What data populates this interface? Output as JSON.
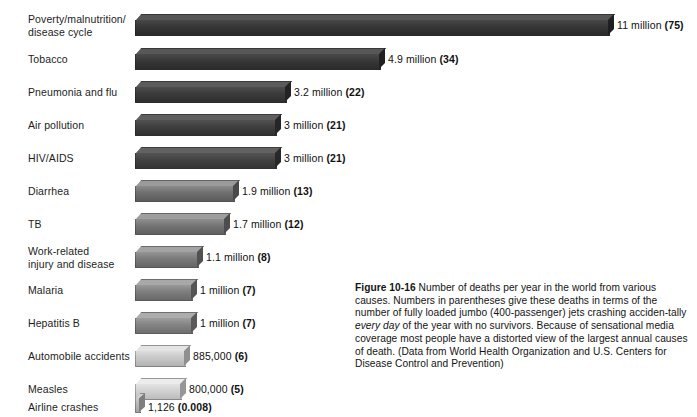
{
  "chart_data": {
    "type": "bar",
    "orientation": "horizontal",
    "title": "",
    "xlabel": "",
    "ylabel": "",
    "categories": [
      "Poverty/malnutrition/\ndisease cycle",
      "Tobacco",
      "Pneumonia and flu",
      "Air pollution",
      "HIV/AIDS",
      "Diarrhea",
      "TB",
      "Work-related\ninjury and disease",
      "Malaria",
      "Hepatitis B",
      "Automobile accidents",
      "Measles",
      "Airline crashes"
    ],
    "values": [
      11000000,
      4900000,
      3200000,
      3000000,
      3000000,
      1900000,
      1700000,
      1100000,
      1000000,
      1000000,
      885000,
      800000,
      1126
    ],
    "value_labels": [
      "11 million",
      "4.9 million",
      "3.2 million",
      "3 million",
      "3 million",
      "1.9 million",
      "1.7 million",
      "1.1 million",
      "1 million",
      "1 million",
      "885,000",
      "800,000",
      "1,126"
    ],
    "jet_equivalents": [
      "75",
      "34",
      "22",
      "21",
      "21",
      "13",
      "12",
      "8",
      "7",
      "7",
      "6",
      "5",
      "0.008"
    ],
    "xlim": [
      0,
      11000000
    ],
    "grid": false,
    "legend": null,
    "bar_colors": [
      "#3a3a3a",
      "#3b3b3b",
      "#3d3d3d",
      "#414141",
      "#444444",
      "#6d6d6d",
      "#727272",
      "#787878",
      "#7c7c7c",
      "#828282",
      "#c3c3c3",
      "#cfcfcf",
      "#b8b8b8"
    ]
  },
  "rows": [
    {
      "label": "Poverty/malnutrition/\ndisease cycle",
      "value_text": "11 million",
      "paren": "(75)"
    },
    {
      "label": "Tobacco",
      "value_text": "4.9 million",
      "paren": "(34)"
    },
    {
      "label": "Pneumonia and flu",
      "value_text": "3.2 million",
      "paren": "(22)"
    },
    {
      "label": "Air pollution",
      "value_text": "3 million",
      "paren": "(21)"
    },
    {
      "label": "HIV/AIDS",
      "value_text": "3 million",
      "paren": "(21)"
    },
    {
      "label": "Diarrhea",
      "value_text": "1.9 million",
      "paren": "(13)"
    },
    {
      "label": "TB",
      "value_text": "1.7 million",
      "paren": "(12)"
    },
    {
      "label": "Work-related\ninjury and disease",
      "value_text": "1.1 million",
      "paren": "(8)"
    },
    {
      "label": "Malaria",
      "value_text": "1 million",
      "paren": "(7)"
    },
    {
      "label": "Hepatitis B",
      "value_text": "1 million",
      "paren": "(7)"
    },
    {
      "label": "Automobile accidents",
      "value_text": "885,000",
      "paren": "(6)"
    },
    {
      "label": "Measles",
      "value_text": "800,000",
      "paren": "(5)"
    },
    {
      "label": "Airline crashes",
      "value_text": "1,126",
      "paren": "(0.008)"
    }
  ],
  "caption": {
    "figure_number": "Figure 10-16",
    "text_1": " Number of deaths per year in the world from various causes. Numbers in parentheses give these deaths in terms of the number of fully loaded jumbo (400-passenger) jets crashing acciden-tally ",
    "emphasis": "every day",
    "text_2": " of the year with no survivors. Because of sensational media coverage most people have a distorted view of the largest annual causes of death. (Data from World Health Organization and U.S. Centers for Disease Control and Prevention)"
  },
  "colors": {
    "background": "#ffffff",
    "text": "#1a1a1a"
  }
}
